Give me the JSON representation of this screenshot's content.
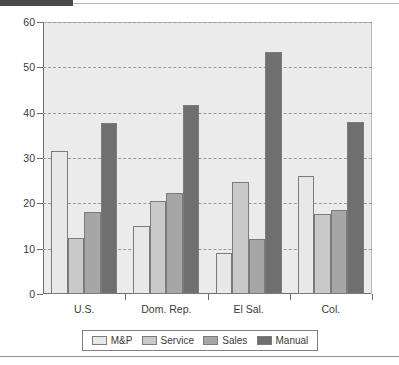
{
  "chart_data": {
    "type": "bar",
    "title": "",
    "subtitle": "",
    "xlabel": "",
    "ylabel": "",
    "categories": [
      "U.S.",
      "Dom. Rep.",
      "El Sal.",
      "Col."
    ],
    "series": [
      {
        "name": "M&P",
        "color": "#e8e8e8",
        "values": [
          31.6,
          15.0,
          9.0,
          26.0
        ]
      },
      {
        "name": "Service",
        "color": "#c9c9c9",
        "values": [
          12.3,
          20.5,
          24.7,
          17.7
        ]
      },
      {
        "name": "Sales",
        "color": "#a6a6a6",
        "values": [
          18.1,
          22.3,
          12.1,
          18.6
        ]
      },
      {
        "name": "Manual",
        "color": "#6f6f6f",
        "values": [
          37.7,
          41.7,
          53.4,
          38.0
        ]
      }
    ],
    "ylim": [
      0,
      60
    ],
    "yticks": [
      0,
      10,
      20,
      30,
      40,
      50,
      60
    ],
    "ytick_labels": [
      "0",
      "10",
      "20",
      "30",
      "40",
      "50",
      "60"
    ],
    "grid": true,
    "grid_style": "dashed-horizontal",
    "legend_position": "bottom",
    "plot_background": "#ebebeb",
    "axis_color": "#6f6f6f",
    "gridline_color": "#9a9a9a"
  },
  "decor": {
    "top_bar_color": "#4a4a4a",
    "top_rule_color": "#b9b9b9",
    "bottom_rule_color": "#8d8d8d"
  }
}
